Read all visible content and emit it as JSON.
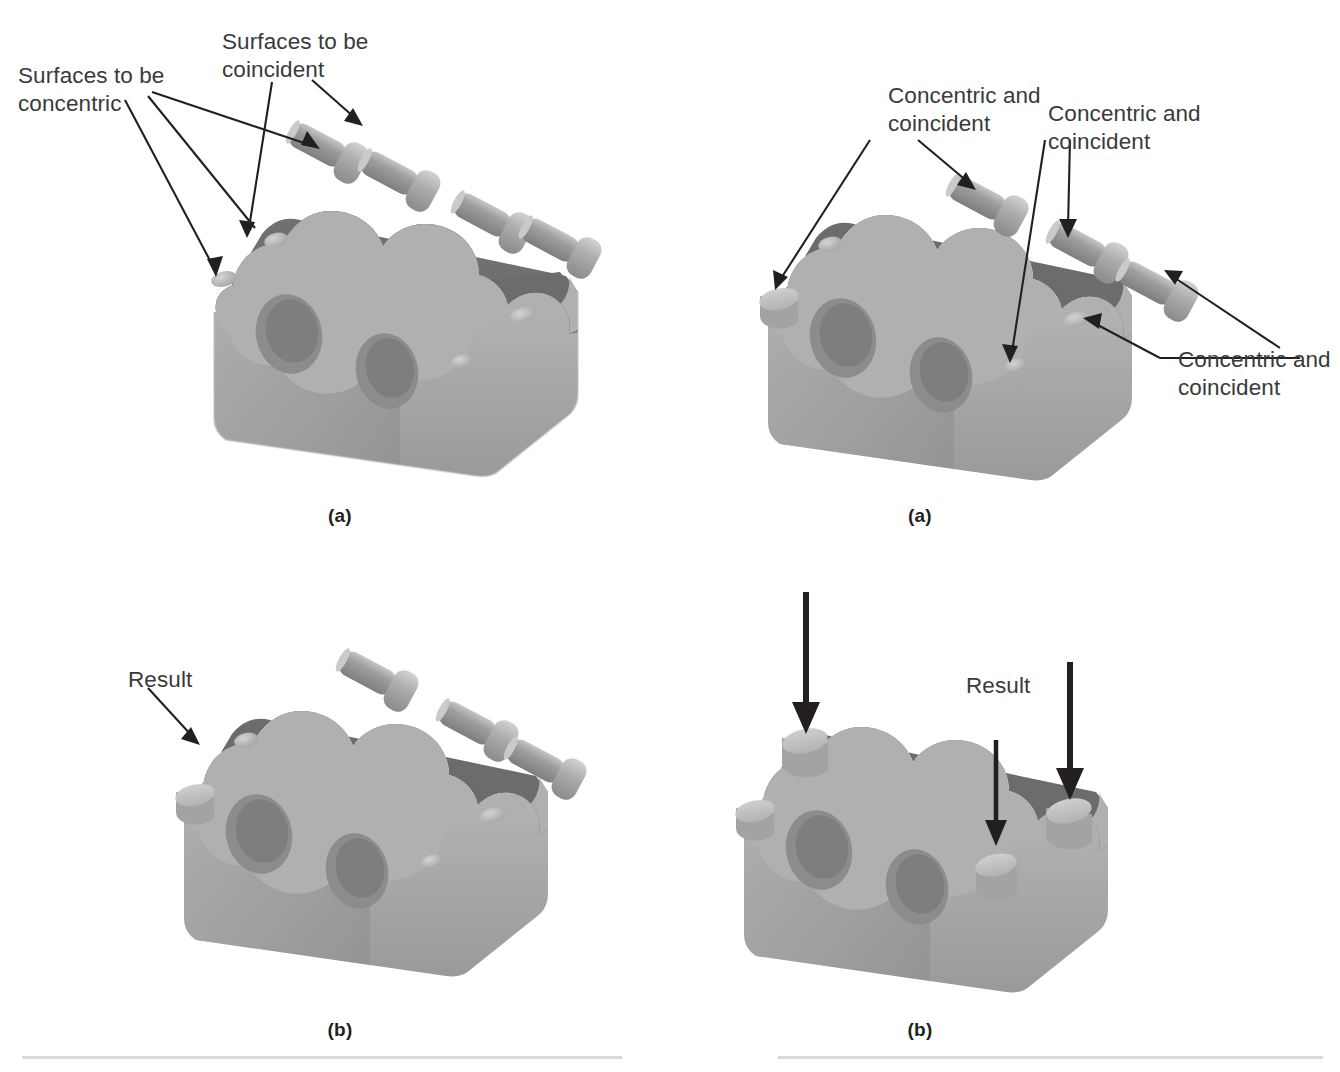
{
  "figure": {
    "background": "#ffffff",
    "width": 1340,
    "height": 1072
  },
  "colors": {
    "text": "#3a3a3a",
    "caption_text": "#231f20",
    "arrow": "#231f20",
    "rule": "#d9d9dc",
    "block_top_dark": "#6f6f71",
    "block_top_mid": "#7c7c7e",
    "block_face_light": "#a7a7a9",
    "block_face_mid": "#99999b",
    "block_edge_highlight": "#c9c9cb",
    "bolt_body": "#9a9a9c",
    "bolt_head": "#b7b7b9",
    "bolt_tip": "#cfcfd1",
    "hole_light": "#bdbdbf",
    "stud_top": "#c5c5c7",
    "stud_side": "#a3a3a5"
  },
  "panels": [
    {
      "id": "top-left",
      "caption": "(a)",
      "bolt_count": 4,
      "placed_stud_count": 0,
      "annotations": [
        {
          "name": "surfaces-to-be-concentric",
          "text": "Surfaces to be\nconcentric",
          "x": 18,
          "y": 62,
          "targets": [
            "left-top-hole",
            "second-top-hole"
          ]
        },
        {
          "name": "surfaces-to-be-coincident",
          "text": "Surfaces to be\ncoincident",
          "x": 222,
          "y": 28,
          "targets": [
            "bolt-1-shoulder",
            "bolt-1-head-underside"
          ]
        }
      ]
    },
    {
      "id": "top-right",
      "caption": "(a)",
      "bolt_count": 3,
      "placed_stud_count": 1,
      "annotations": [
        {
          "name": "concentric-and-coincident-left",
          "text": "Concentric and\ncoincident",
          "x": 888,
          "y": 82,
          "targets": [
            "left-top-hole",
            "bolt-1-shoulder"
          ]
        },
        {
          "name": "concentric-and-coincident-center",
          "text": "Concentric and\ncoincident",
          "x": 1048,
          "y": 100,
          "targets": [
            "right-front-hole",
            "bolt-2-shoulder"
          ]
        },
        {
          "name": "concentric-and-coincident-right",
          "text": "Concentric and\ncoincident",
          "x": 1178,
          "y": 346,
          "targets": [
            "right-top-hole",
            "bolt-3-shoulder"
          ]
        }
      ]
    },
    {
      "id": "bottom-left",
      "caption": "(b)",
      "bolt_count": 3,
      "placed_stud_count": 1,
      "annotations": [
        {
          "name": "result-label-left",
          "text": "Result",
          "x": 128,
          "y": 666,
          "targets": [
            "installed-stud"
          ]
        }
      ]
    },
    {
      "id": "bottom-right",
      "caption": "(b)",
      "bolt_count": 0,
      "placed_stud_count": 4,
      "annotations": [
        {
          "name": "result-label-right",
          "text": "Result",
          "x": 966,
          "y": 672,
          "targets": [
            "installed-studs"
          ]
        }
      ],
      "insert_arrow_count": 3
    }
  ],
  "captions": [
    {
      "name": "caption-top-left",
      "label": "(a)",
      "x": 300,
      "y": 505
    },
    {
      "name": "caption-top-right",
      "label": "(a)",
      "x": 880,
      "y": 505
    },
    {
      "name": "caption-bottom-left",
      "label": "(b)",
      "x": 300,
      "y": 1019
    },
    {
      "name": "caption-bottom-right",
      "label": "(b)",
      "x": 880,
      "y": 1019
    }
  ],
  "rules": [
    {
      "name": "rule-left",
      "x": 22,
      "y": 1056,
      "width": 600
    },
    {
      "name": "rule-right",
      "x": 778,
      "y": 1056,
      "width": 545
    }
  ]
}
